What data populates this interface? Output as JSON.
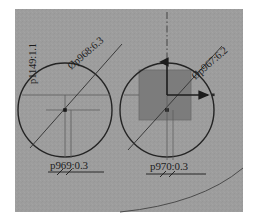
{
  "view": {
    "title": "CAD technical drawing viewport",
    "canvas_background": "#9d9d9d",
    "page_background": "#ffffff",
    "line_color": "#2a2a2a",
    "thin_line_color": "#555555",
    "fill_color": "#7c7c7c",
    "text_color": "#1c1c1c",
    "width": 258,
    "height": 221
  },
  "annotations": {
    "diameter_left": "Øp968:6.3",
    "diameter_right": "Øp967:6.2",
    "vertical_left": "p1149:1.1",
    "dimension_left": "p969:0.3",
    "dimension_right": "p970:0.3"
  },
  "geometry": {
    "circle_left": {
      "cx": 65,
      "cy": 110,
      "r": 47,
      "label": "Øp968:6.3"
    },
    "circle_right": {
      "cx": 167,
      "cy": 110,
      "r": 47,
      "label": "Øp967:6.2"
    },
    "square_fill": {
      "x": 139,
      "y": 70,
      "w": 52,
      "h": 50
    },
    "origin_marker": {
      "x": 167,
      "y": 95
    },
    "axis_arrow_x_end": {
      "x": 213,
      "y": 95
    },
    "centerline_top": {
      "x": 167,
      "y": 12
    }
  }
}
